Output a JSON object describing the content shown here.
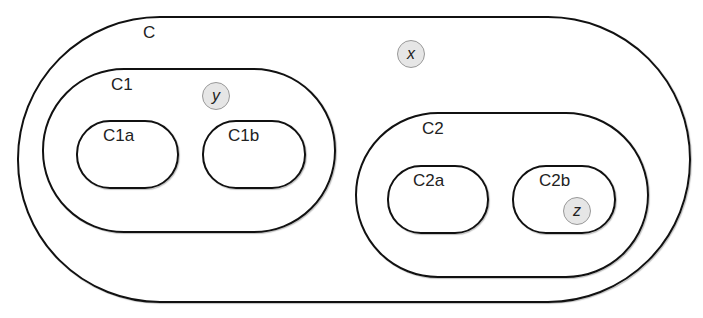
{
  "diagram": {
    "containers": [
      {
        "id": "C",
        "label": "C"
      },
      {
        "id": "C1",
        "label": "C1"
      },
      {
        "id": "C1a",
        "label": "C1a"
      },
      {
        "id": "C1b",
        "label": "C1b"
      },
      {
        "id": "C2",
        "label": "C2"
      },
      {
        "id": "C2a",
        "label": "C2a"
      },
      {
        "id": "C2b",
        "label": "C2b"
      }
    ],
    "points": [
      {
        "id": "x",
        "label": "x",
        "in": "C"
      },
      {
        "id": "y",
        "label": "y",
        "in": "C1"
      },
      {
        "id": "z",
        "label": "z",
        "in": "C2b"
      }
    ]
  }
}
